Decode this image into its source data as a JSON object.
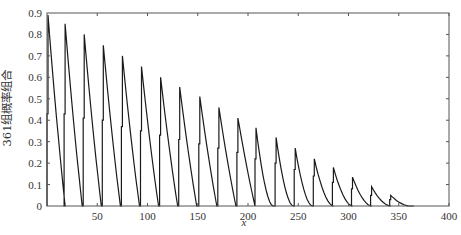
{
  "chart_data": {
    "type": "line",
    "title": "",
    "xlabel": "x",
    "ylabel": "361组概率组合",
    "xlim": [
      0,
      400
    ],
    "ylim": [
      0,
      0.9
    ],
    "grid": false,
    "legend": null,
    "x_ticks": [
      50,
      100,
      150,
      200,
      250,
      300,
      350,
      400
    ],
    "y_ticks": [
      0,
      0.1,
      0.2,
      0.3,
      0.4,
      0.5,
      0.6,
      0.7,
      0.8,
      0.9
    ],
    "x_tick_labels": [
      "50",
      "100",
      "150",
      "200",
      "250",
      "300",
      "350",
      "400"
    ],
    "y_tick_labels": [
      "0",
      "0.1",
      "0.2",
      "0.3",
      "0.4",
      "0.5",
      "0.6",
      "0.7",
      "0.8",
      "0.9"
    ],
    "cycles": {
      "start_x": [
        0,
        17,
        36,
        55,
        74,
        93,
        112,
        131,
        151,
        170,
        189,
        207,
        227,
        246,
        265,
        284,
        303,
        322,
        341
      ],
      "peak_x": [
        1,
        18,
        37,
        56,
        75,
        94,
        113,
        132,
        152,
        171,
        190,
        208,
        228,
        247,
        266,
        285,
        304,
        323,
        342
      ],
      "peak_y": [
        0.89,
        0.85,
        0.8,
        0.75,
        0.7,
        0.65,
        0.6,
        0.555,
        0.51,
        0.46,
        0.41,
        0.365,
        0.32,
        0.27,
        0.22,
        0.18,
        0.135,
        0.09,
        0.05
      ],
      "mid_step_y": [
        0.43,
        0.43,
        0.41,
        0.4,
        0.37,
        0.35,
        0.33,
        0.31,
        0.29,
        0.27,
        0.25,
        0.22,
        0.2,
        0.17,
        0.14,
        0.11,
        0.08,
        0.05,
        0.03
      ],
      "decay_length": 17
    }
  },
  "colors": {
    "line": "#1a1a1a",
    "axis": "#555555",
    "background": "#ffffff"
  }
}
